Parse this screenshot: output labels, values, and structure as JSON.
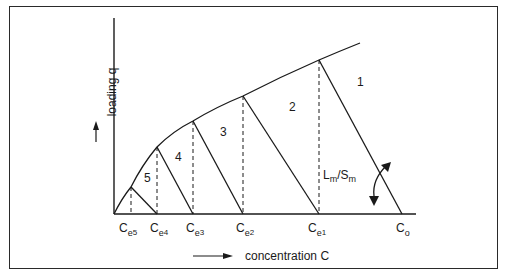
{
  "diagram": {
    "type": "multistage batch adsorption operating diagram",
    "y_axis": {
      "label": "loading q",
      "arrow": "up"
    },
    "x_axis": {
      "label": "concentration C",
      "arrow": "right"
    },
    "x_ticks": [
      {
        "base": "C",
        "sub": "e",
        "subsub": "5"
      },
      {
        "base": "C",
        "sub": "e",
        "subsub": "4"
      },
      {
        "base": "C",
        "sub": "e",
        "subsub": "3"
      },
      {
        "base": "C",
        "sub": "e",
        "subsub": "2"
      },
      {
        "base": "C",
        "sub": "e",
        "subsub": "1"
      },
      {
        "base": "C",
        "sub": "o",
        "subsub": ""
      }
    ],
    "stages": [
      "1",
      "2",
      "3",
      "4",
      "5"
    ],
    "slope_label": {
      "L": "L",
      "L_sub": "m",
      "sep": "/",
      "S": "S",
      "S_sub": "m"
    },
    "curve": "isotherm (concave)",
    "colors": {
      "line": "#1a1a1a",
      "background": "#ffffff"
    }
  }
}
